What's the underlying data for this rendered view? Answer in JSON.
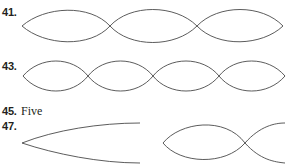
{
  "top_cutoff_text": "ate ateater.",
  "items": [
    {
      "number": "41.",
      "type": "figure",
      "description": "standing wave, two half-wavelength loops"
    },
    {
      "number": "43.",
      "type": "figure",
      "description": "standing wave, four half-wavelength loops"
    },
    {
      "number": "45.",
      "type": "text",
      "answer": "Five"
    },
    {
      "number": "47.",
      "type": "figure",
      "description": "open-end tube fundamental and closed-end tube harmonic"
    }
  ],
  "colors": {
    "text": "#231f20",
    "stroke": "#4a4a4a",
    "background": "#ffffff"
  }
}
